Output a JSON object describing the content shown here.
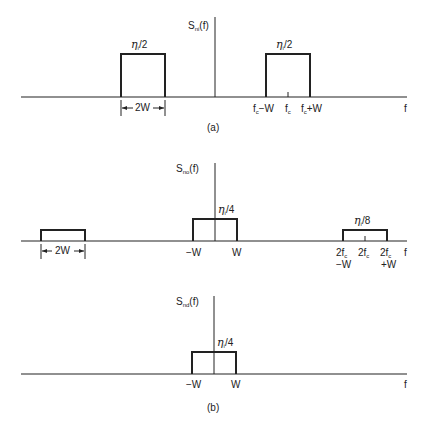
{
  "diagram": {
    "panel_a": {
      "caption": "(a)",
      "y_axis_label": "S",
      "y_axis_sub": "ni",
      "y_axis_arg": "(f)",
      "x_axis_label": "f",
      "blocks": [
        {
          "label_eta": "η",
          "label_sub": "i",
          "label_rest": "/2",
          "center": "-fc",
          "width_label": "2W"
        },
        {
          "label_eta": "η",
          "label_sub": "i",
          "label_rest": "/2",
          "center": "fc"
        }
      ],
      "ticks": {
        "left": {
          "main": "f",
          "sub": "c",
          "rest": "−W"
        },
        "center": {
          "main": "f",
          "sub": "c",
          "rest": ""
        },
        "right": {
          "main": "f",
          "sub": "c",
          "rest": "+W"
        }
      },
      "width_marker": "2W"
    },
    "panel_b_top": {
      "y_axis_label": "S",
      "y_axis_sub": "no",
      "y_axis_arg": "(f)",
      "x_axis_label": "f",
      "blocks": [
        {
          "label_eta": "η",
          "label_sub": "i",
          "label_rest": "/4",
          "center": "0"
        },
        {
          "label_eta": "η",
          "label_sub": "i",
          "label_rest": "/8",
          "center": "2fc"
        },
        {
          "center": "-2fc",
          "width_label": "2W"
        }
      ],
      "ticks": {
        "minus_w": "−W",
        "plus_w": "W",
        "left2": {
          "main": "2f",
          "sub": "c",
          "line2": "−W"
        },
        "center2": {
          "main": "2f",
          "sub": "c"
        },
        "right2": {
          "main": "2f",
          "sub": "c",
          "line2": "+W"
        }
      },
      "width_marker": "2W"
    },
    "panel_b_bottom": {
      "caption": "(b)",
      "y_axis_label": "S",
      "y_axis_sub": "nd",
      "y_axis_arg": "(f)",
      "x_axis_label": "f",
      "blocks": [
        {
          "label_eta": "η",
          "label_sub": "i",
          "label_rest": "/4",
          "center": "0"
        }
      ],
      "ticks": {
        "minus_w": "−W",
        "plus_w": "W"
      }
    }
  }
}
